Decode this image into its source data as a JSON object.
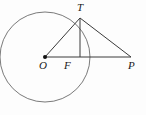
{
  "figure": {
    "kind": "geometry-diagram",
    "width": 146,
    "height": 115,
    "background_color": "#fdfdfd",
    "stroke_color": "#3a3a3a",
    "label_color": "#1a1a1a"
  },
  "labels": {
    "center": "O",
    "tangent_point": "T",
    "foot": "F",
    "external_point": "P"
  },
  "geometry": {
    "circle": {
      "cx": 45,
      "cy": 57,
      "r": 45
    },
    "points": {
      "O": {
        "x": 45,
        "y": 57
      },
      "T": {
        "x": 80,
        "y": 18
      },
      "F": {
        "x": 80,
        "y": 57
      },
      "P": {
        "x": 131,
        "y": 57
      }
    },
    "segments": [
      {
        "name": "OT",
        "from": "O",
        "to": "T"
      },
      {
        "name": "OP",
        "from": "O",
        "to": "P"
      },
      {
        "name": "TF",
        "from": "T",
        "to": "F"
      },
      {
        "name": "TP",
        "from": "T",
        "to": "P"
      }
    ],
    "center_dot_radius": 2
  }
}
